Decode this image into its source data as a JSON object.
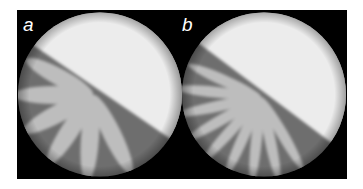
{
  "figure": {
    "panels": [
      {
        "label": "a",
        "petal_count": 6,
        "description": "circular cell with diagonal interface; lower-left region shows 6 broad light fingers radiating from a central point"
      },
      {
        "label": "b",
        "petal_count": 9,
        "description": "circular cell with diagonal interface; lower-left region shows 9 narrower light fingers radiating from a central point"
      }
    ],
    "colors": {
      "background": "#000000",
      "upper_region": "#ececec",
      "lower_region": "#6e6e6e",
      "fingers": "#bdbdbd",
      "label": "#ffffff"
    }
  }
}
